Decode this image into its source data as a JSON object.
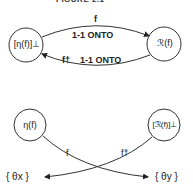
{
  "header": {
    "title_clipped": "FIGURE 2.1 DIAGRAM"
  },
  "top_diagram": {
    "left_node": "[η(f)]⊥",
    "right_node": "ℛ(f)",
    "forward_map": "f",
    "forward_property": "1-1  ONTO",
    "inverse_map": "f†",
    "inverse_property": "1-1  ONTO"
  },
  "bottom_diagram": {
    "left_node": "η(f)",
    "right_node": "[ℛ(f)]⊥",
    "map_left": "f",
    "map_right": "f†",
    "target_left": "{ θx }",
    "target_right": "{ θy }"
  }
}
